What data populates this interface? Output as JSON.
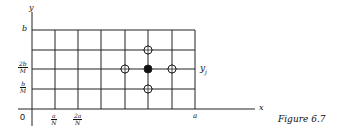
{
  "figure": {
    "caption": "Figure 6.7",
    "axes": {
      "x_label": "x",
      "y_label": "y",
      "origin_label": "0"
    },
    "x_ticks": [
      {
        "num": "a",
        "den": "N"
      },
      {
        "num": "2a",
        "den": "N"
      }
    ],
    "x_end_label": "a",
    "y_ticks": [
      {
        "num": "b",
        "den": "M"
      },
      {
        "num": "2b",
        "den": "M"
      }
    ],
    "y_end_label": "b",
    "row_label": "y",
    "row_label_sub": "j",
    "grid": {
      "columns": 7,
      "rows": 4
    },
    "stencil": {
      "center": {
        "col": 5,
        "row": 2,
        "style": "filled"
      },
      "neighbors": [
        {
          "col": 4,
          "row": 2,
          "style": "open"
        },
        {
          "col": 6,
          "row": 2,
          "style": "open"
        },
        {
          "col": 5,
          "row": 3,
          "style": "open"
        },
        {
          "col": 5,
          "row": 1,
          "style": "open"
        }
      ]
    }
  }
}
